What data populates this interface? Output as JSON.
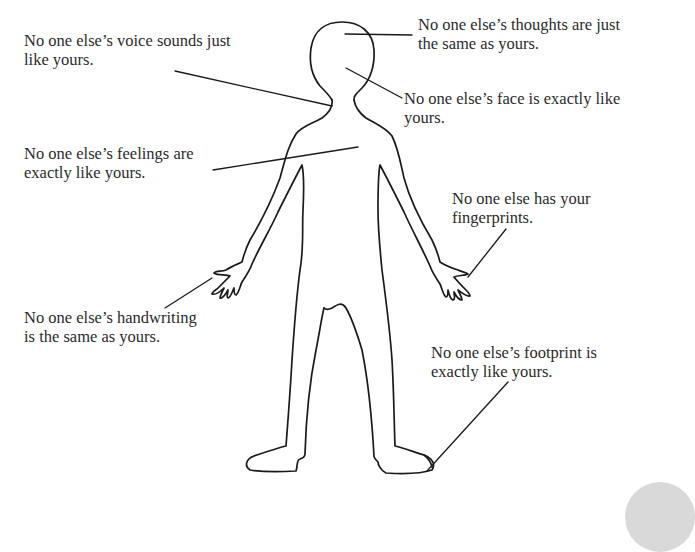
{
  "diagram": {
    "stroke_color": "#1a1a1a",
    "text_color": "#2b2b2b",
    "background": "#ffffff"
  },
  "labels": {
    "voice": {
      "line1": "No one else’s voice sounds just",
      "line2": "like yours."
    },
    "thoughts": {
      "line1": "No one else’s thoughts are just",
      "line2": "the same as yours."
    },
    "face": {
      "line1": "No one else’s face is exactly like",
      "line2": "yours."
    },
    "feelings": {
      "line1": "No one else’s feelings are",
      "line2": "exactly like yours."
    },
    "fingerprints": {
      "line1": "No one else has your",
      "line2": "fingerprints."
    },
    "handwriting": {
      "line1": "No one else’s handwriting",
      "line2": "is the same as yours."
    },
    "footprint": {
      "line1": "No one else’s footprint is",
      "line2": "exactly like yours."
    }
  }
}
